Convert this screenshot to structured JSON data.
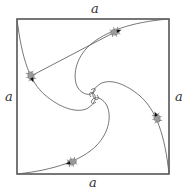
{
  "figure": {
    "labels": {
      "top": "a",
      "left": "a",
      "right": "a",
      "bottom": "a"
    },
    "colors": {
      "square": "#555555",
      "curve": "#666666",
      "bug_body": "#9a9a9a",
      "bug_head": "#111111",
      "background": "#ffffff"
    },
    "square": {
      "x0": 17,
      "y0": 19,
      "x1": 169,
      "y1": 174
    },
    "center": [
      94,
      96
    ],
    "bugs": [
      {
        "name": "bug-top-left-path",
        "x": 31,
        "y": 76,
        "angle": 70
      },
      {
        "name": "bug-top-path",
        "x": 115,
        "y": 32,
        "angle": -18
      },
      {
        "name": "bug-right-path",
        "x": 157,
        "y": 118,
        "angle": 250
      },
      {
        "name": "bug-bottom-path",
        "x": 72,
        "y": 162,
        "angle": 162
      }
    ],
    "sight_line": {
      "from": [
        31,
        76
      ],
      "to": [
        113,
        33
      ]
    }
  }
}
